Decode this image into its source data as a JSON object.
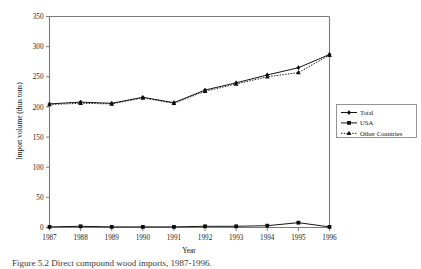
{
  "figure": {
    "caption": "Figure 5.2 Direct compound wood imports, 1987-1996."
  },
  "chart_data": {
    "type": "line",
    "title": "",
    "xlabel": "Year",
    "ylabel": "Import volume (thus tons)",
    "categories": [
      "1987",
      "1988",
      "1989",
      "1990",
      "1991",
      "1992",
      "1993",
      "1994",
      "1995",
      "1996"
    ],
    "x": [
      1987,
      1988,
      1989,
      1990,
      1991,
      1992,
      1993,
      1994,
      1995,
      1996
    ],
    "xlim": [
      1987,
      1996
    ],
    "ylim": [
      0,
      350
    ],
    "yticks": [
      0,
      50,
      100,
      150,
      200,
      250,
      300,
      350
    ],
    "xticks": [
      "1987",
      "1988",
      "1989",
      "1990",
      "1991",
      "1992",
      "1993",
      "1994",
      "1995",
      "1996"
    ],
    "grid": false,
    "legend_position": "right",
    "series": [
      {
        "name": "Total",
        "marker": "diamond",
        "linestyle": "solid",
        "color": "#0d0d0d",
        "values": [
          205,
          208,
          206,
          216,
          207,
          228,
          240,
          253,
          265,
          287
        ]
      },
      {
        "name": "USA",
        "marker": "square",
        "linestyle": "solid",
        "color": "#0d0d0d",
        "values": [
          1,
          2,
          1,
          1,
          1,
          2,
          2,
          3,
          8,
          1
        ]
      },
      {
        "name": "Other Countries",
        "marker": "triangle",
        "linestyle": "dotted",
        "color": "#0d0d0d",
        "values": [
          204,
          206,
          205,
          215,
          206,
          226,
          238,
          250,
          257,
          286
        ]
      }
    ]
  },
  "legend": {
    "entries": [
      {
        "label": "Total"
      },
      {
        "label": "USA"
      },
      {
        "label": "Other Countries"
      }
    ]
  },
  "axes": {
    "y_title": "Import volume (thus tons)",
    "x_title": "Year",
    "y_tick_labels": [
      "0",
      "50",
      "100",
      "150",
      "200",
      "250",
      "300",
      "350"
    ],
    "x_tick_labels": [
      "1987",
      "1988",
      "1989",
      "1990",
      "1991",
      "1992",
      "1993",
      "1994",
      "1995",
      "1996"
    ]
  }
}
